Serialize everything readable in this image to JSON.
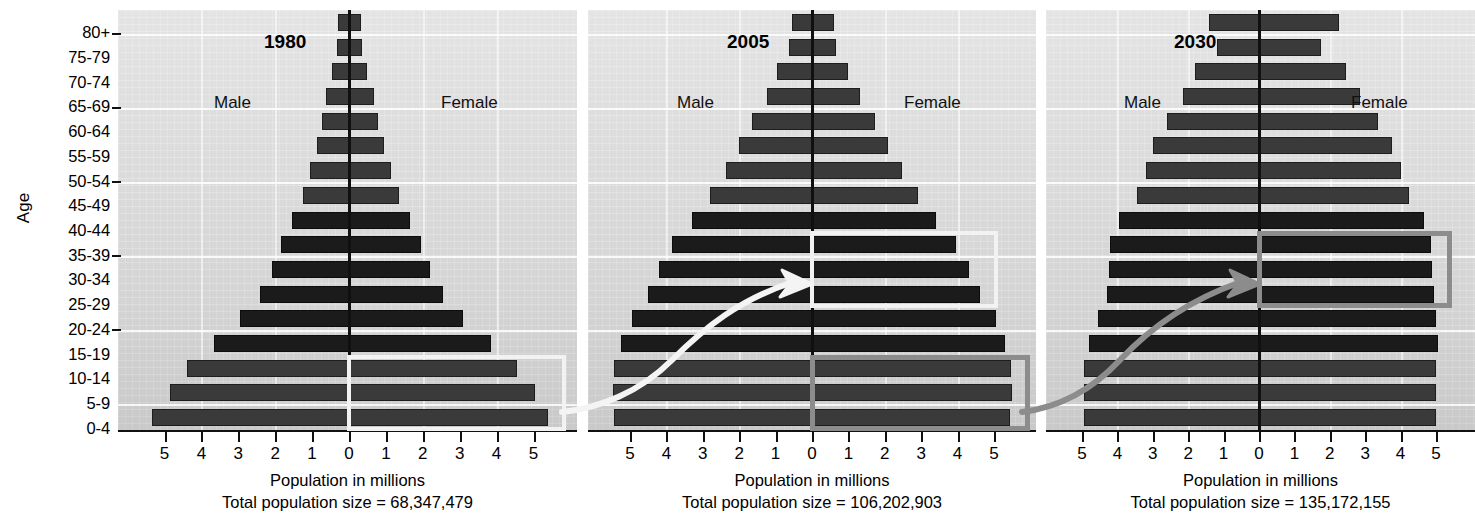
{
  "axis": {
    "y_title": "Age",
    "age_groups": [
      "80+",
      "75-79",
      "70-74",
      "65-69",
      "60-64",
      "55-59",
      "50-54",
      "45-49",
      "40-44",
      "35-39",
      "30-34",
      "25-29",
      "20-24",
      "15-19",
      "10-14",
      "5-9",
      "0-4"
    ],
    "x_ticks": [
      "5",
      "4",
      "3",
      "2",
      "1",
      "0",
      "1",
      "2",
      "3",
      "4",
      "5"
    ],
    "x_caption": "Population in millions",
    "total_prefix": "Total population size = "
  },
  "labels": {
    "male": "Male",
    "female": "Female"
  },
  "colors": {
    "panel_background": "#d8d8d8",
    "bar_dark": "#3a3a3a",
    "bar_black": "#1b1b1b",
    "centerline": "#101010",
    "highlight_white": "#f2f2f2",
    "highlight_gray": "#8c8c8c"
  },
  "panels": [
    {
      "year": "1980",
      "total_population": "68,347,479",
      "total_line": "Total population size = 68,347,479",
      "highlight": {
        "style": "white",
        "age_groups": [
          "10-14",
          "5-9",
          "0-4"
        ],
        "side": "female"
      }
    },
    {
      "year": "2005",
      "total_population": "106,202,903",
      "total_line": "Total population size = 106,202,903",
      "highlight": {
        "style": "white",
        "age_groups": [
          "35-39",
          "30-34",
          "25-29"
        ],
        "side": "female"
      },
      "highlight2": {
        "style": "gray",
        "age_groups": [
          "10-14",
          "5-9",
          "0-4"
        ],
        "side": "female"
      }
    },
    {
      "year": "2030",
      "total_population": "135,172,155",
      "total_line": "Total population size = 135,172,155",
      "highlight": {
        "style": "gray",
        "age_groups": [
          "35-39",
          "30-34",
          "25-29"
        ],
        "side": "female"
      }
    }
  ],
  "chart_data": {
    "type": "bar",
    "chart_kind": "population-pyramid",
    "title": "",
    "xlabel": "Population in millions",
    "ylabel": "Age",
    "xlim": [
      -5.5,
      5.5
    ],
    "x_ticks": [
      5,
      4,
      3,
      2,
      1,
      0,
      1,
      2,
      3,
      4,
      5
    ],
    "grid": true,
    "legend": [
      "Male",
      "Female"
    ],
    "legend_position": "inside-top",
    "categories": [
      "80+",
      "75-79",
      "70-74",
      "65-69",
      "60-64",
      "55-59",
      "50-54",
      "45-49",
      "40-44",
      "35-39",
      "30-34",
      "25-29",
      "20-24",
      "15-19",
      "10-14",
      "5-9",
      "0-4"
    ],
    "panels": [
      {
        "name": "1980",
        "total_population": 68347479,
        "series": [
          {
            "name": "Male",
            "values": [
              0.3,
              0.32,
              0.45,
              0.62,
              0.72,
              0.88,
              1.05,
              1.25,
              1.55,
              1.85,
              2.1,
              2.4,
              2.95,
              3.65,
              4.4,
              4.85,
              5.35
            ]
          },
          {
            "name": "Female",
            "values": [
              0.32,
              0.35,
              0.5,
              0.68,
              0.78,
              0.95,
              1.15,
              1.35,
              1.65,
              1.95,
              2.2,
              2.55,
              3.1,
              3.85,
              4.55,
              5.05,
              5.4
            ]
          }
        ]
      },
      {
        "name": "2005",
        "total_population": 106202903,
        "series": [
          {
            "name": "Male",
            "values": [
              0.55,
              0.62,
              0.95,
              1.25,
              1.65,
              2.0,
              2.35,
              2.8,
              3.3,
              3.85,
              4.2,
              4.5,
              4.95,
              5.25,
              5.45,
              5.48,
              5.45
            ]
          },
          {
            "name": "Female",
            "values": [
              0.6,
              0.65,
              1.0,
              1.32,
              1.72,
              2.1,
              2.48,
              2.9,
              3.42,
              3.95,
              4.3,
              4.62,
              5.05,
              5.3,
              5.48,
              5.5,
              5.45
            ]
          }
        ]
      },
      {
        "name": "2030",
        "total_population": 135172155,
        "series": [
          {
            "name": "Male",
            "values": [
              1.4,
              1.2,
              1.8,
              2.15,
              2.6,
              3.0,
              3.2,
              3.45,
              3.95,
              4.2,
              4.25,
              4.3,
              4.55,
              4.8,
              4.95,
              4.95,
              4.95
            ]
          },
          {
            "name": "Female",
            "values": [
              2.25,
              1.75,
              2.45,
              2.85,
              3.35,
              3.75,
              4.0,
              4.25,
              4.65,
              4.85,
              4.9,
              4.95,
              5.0,
              5.05,
              5.0,
              5.0,
              5.0
            ]
          }
        ]
      }
    ]
  }
}
